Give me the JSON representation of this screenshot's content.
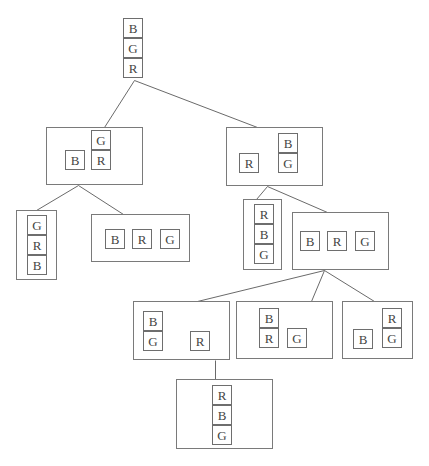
{
  "diagram": {
    "type": "search-tree",
    "nodes": [
      {
        "id": "root",
        "box": null,
        "blocks": [
          {
            "label": "B",
            "x": 123,
            "y": 18,
            "w": 20,
            "h": 20
          },
          {
            "label": "G",
            "x": 123,
            "y": 38,
            "w": 20,
            "h": 20
          },
          {
            "label": "R",
            "x": 123,
            "y": 58,
            "w": 20,
            "h": 20
          }
        ]
      },
      {
        "id": "n1",
        "box": {
          "x": 46,
          "y": 127,
          "w": 97,
          "h": 58
        },
        "blocks": [
          {
            "label": "B",
            "x": 65,
            "y": 150,
            "w": 20,
            "h": 20
          },
          {
            "label": "G",
            "x": 91,
            "y": 130,
            "w": 20,
            "h": 20
          },
          {
            "label": "R",
            "x": 91,
            "y": 150,
            "w": 20,
            "h": 20
          }
        ]
      },
      {
        "id": "n2",
        "box": {
          "x": 226,
          "y": 127,
          "w": 97,
          "h": 59
        },
        "blocks": [
          {
            "label": "R",
            "x": 239,
            "y": 153,
            "w": 20,
            "h": 20
          },
          {
            "label": "B",
            "x": 278,
            "y": 133,
            "w": 20,
            "h": 20
          },
          {
            "label": "G",
            "x": 278,
            "y": 153,
            "w": 20,
            "h": 20
          }
        ]
      },
      {
        "id": "n3",
        "box": {
          "x": 16,
          "y": 210,
          "w": 41,
          "h": 70
        },
        "blocks": [
          {
            "label": "G",
            "x": 27,
            "y": 215,
            "w": 20,
            "h": 20
          },
          {
            "label": "R",
            "x": 27,
            "y": 235,
            "w": 20,
            "h": 20
          },
          {
            "label": "B",
            "x": 27,
            "y": 255,
            "w": 20,
            "h": 20
          }
        ]
      },
      {
        "id": "n4",
        "box": {
          "x": 91,
          "y": 214,
          "w": 99,
          "h": 48
        },
        "blocks": [
          {
            "label": "B",
            "x": 105,
            "y": 229,
            "w": 20,
            "h": 20
          },
          {
            "label": "R",
            "x": 132,
            "y": 229,
            "w": 20,
            "h": 20
          },
          {
            "label": "G",
            "x": 160,
            "y": 229,
            "w": 20,
            "h": 20
          }
        ]
      },
      {
        "id": "n5",
        "box": {
          "x": 243,
          "y": 199,
          "w": 39,
          "h": 71
        },
        "blocks": [
          {
            "label": "R",
            "x": 254,
            "y": 204,
            "w": 20,
            "h": 20
          },
          {
            "label": "B",
            "x": 254,
            "y": 224,
            "w": 20,
            "h": 20
          },
          {
            "label": "G",
            "x": 254,
            "y": 244,
            "w": 20,
            "h": 20
          }
        ]
      },
      {
        "id": "n6",
        "box": {
          "x": 292,
          "y": 212,
          "w": 97,
          "h": 58
        },
        "blocks": [
          {
            "label": "B",
            "x": 300,
            "y": 231,
            "w": 20,
            "h": 20
          },
          {
            "label": "R",
            "x": 327,
            "y": 231,
            "w": 20,
            "h": 20
          },
          {
            "label": "G",
            "x": 355,
            "y": 231,
            "w": 20,
            "h": 20
          }
        ]
      },
      {
        "id": "n7",
        "box": {
          "x": 133,
          "y": 301,
          "w": 97,
          "h": 59
        },
        "blocks": [
          {
            "label": "B",
            "x": 143,
            "y": 311,
            "w": 20,
            "h": 20
          },
          {
            "label": "G",
            "x": 143,
            "y": 331,
            "w": 20,
            "h": 20
          },
          {
            "label": "R",
            "x": 190,
            "y": 331,
            "w": 20,
            "h": 20
          }
        ]
      },
      {
        "id": "n8",
        "box": {
          "x": 236,
          "y": 301,
          "w": 97,
          "h": 58
        },
        "blocks": [
          {
            "label": "B",
            "x": 259,
            "y": 308,
            "w": 20,
            "h": 20
          },
          {
            "label": "R",
            "x": 259,
            "y": 328,
            "w": 20,
            "h": 20
          },
          {
            "label": "G",
            "x": 287,
            "y": 328,
            "w": 20,
            "h": 20
          }
        ]
      },
      {
        "id": "n9",
        "box": {
          "x": 342,
          "y": 301,
          "w": 71,
          "h": 58
        },
        "blocks": [
          {
            "label": "B",
            "x": 353,
            "y": 329,
            "w": 20,
            "h": 20
          },
          {
            "label": "R",
            "x": 382,
            "y": 308,
            "w": 20,
            "h": 20
          },
          {
            "label": "G",
            "x": 382,
            "y": 328,
            "w": 20,
            "h": 20
          }
        ]
      },
      {
        "id": "n10",
        "box": {
          "x": 176,
          "y": 379,
          "w": 97,
          "h": 70
        },
        "blocks": [
          {
            "label": "R",
            "x": 212,
            "y": 385,
            "w": 20,
            "h": 20
          },
          {
            "label": "B",
            "x": 212,
            "y": 405,
            "w": 20,
            "h": 20
          },
          {
            "label": "G",
            "x": 212,
            "y": 425,
            "w": 20,
            "h": 20
          }
        ]
      }
    ],
    "edges": [
      {
        "from": "root",
        "to": "n1",
        "x1": 134,
        "y1": 80,
        "x2": 104,
        "y2": 127
      },
      {
        "from": "root",
        "to": "n2",
        "x1": 134,
        "y1": 80,
        "x2": 257,
        "y2": 127
      },
      {
        "from": "n1",
        "to": "n3",
        "x1": 78,
        "y1": 185,
        "x2": 36,
        "y2": 210
      },
      {
        "from": "n1",
        "to": "n4",
        "x1": 78,
        "y1": 185,
        "x2": 123,
        "y2": 214
      },
      {
        "from": "n2",
        "to": "n5",
        "x1": 267,
        "y1": 186,
        "x2": 256,
        "y2": 199
      },
      {
        "from": "n2",
        "to": "n6",
        "x1": 267,
        "y1": 186,
        "x2": 327,
        "y2": 212
      },
      {
        "from": "n6",
        "to": "n7",
        "x1": 324,
        "y1": 270,
        "x2": 197,
        "y2": 301
      },
      {
        "from": "n6",
        "to": "n8",
        "x1": 324,
        "y1": 270,
        "x2": 311,
        "y2": 301
      },
      {
        "from": "n6",
        "to": "n9",
        "x1": 324,
        "y1": 270,
        "x2": 374,
        "y2": 301
      },
      {
        "from": "n7",
        "to": "n10",
        "x1": 215,
        "y1": 360,
        "x2": 215,
        "y2": 379
      }
    ]
  }
}
